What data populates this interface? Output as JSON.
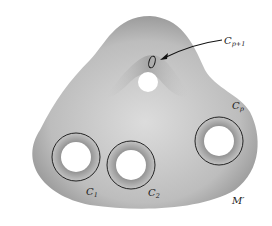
{
  "diagram": {
    "surface_name": "M′",
    "colors": {
      "surface_light": "#d6d6d6",
      "surface_dark": "#8a8a8a",
      "curve": "#111111",
      "hole": "#ffffff"
    },
    "labels": {
      "c1": {
        "base": "C",
        "sub": "1"
      },
      "c2": {
        "base": "C",
        "sub": "2"
      },
      "cp": {
        "base": "C",
        "sub": "p"
      },
      "cp1": {
        "base": "C",
        "sub": "p+1"
      },
      "surface": "M′"
    }
  }
}
